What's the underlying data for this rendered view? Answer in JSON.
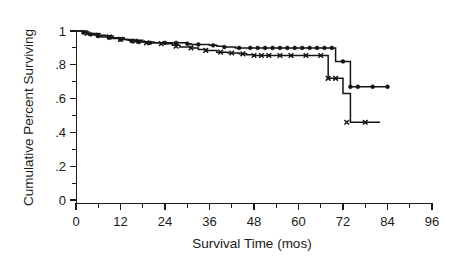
{
  "chart_data": {
    "type": "line",
    "title": "",
    "xlabel": "Survival Time (mos)",
    "ylabel": "Cumulative Percent Surviving",
    "xlim": [
      0,
      96
    ],
    "ylim": [
      0,
      1
    ],
    "grid": false,
    "legend": "none",
    "x_ticks": [
      0,
      12,
      24,
      36,
      48,
      60,
      72,
      84,
      96
    ],
    "x_tick_labels": [
      "0",
      "12",
      "24",
      "36",
      "48",
      "60",
      "72",
      "84",
      "96"
    ],
    "x_minor_ticks": [
      6,
      18,
      30,
      42,
      54,
      66,
      78,
      90
    ],
    "y_ticks": [
      0,
      0.2,
      0.4,
      0.6,
      0.8,
      1
    ],
    "y_tick_labels": [
      "0",
      ".2",
      ".4",
      ".6",
      ".8",
      "1"
    ],
    "y_minor_ticks": [
      0.1,
      0.3,
      0.5,
      0.7,
      0.9
    ],
    "series": [
      {
        "name": "group-circle",
        "marker": "circle",
        "steps_x": [
          0,
          2,
          3,
          4,
          5,
          6,
          7,
          9,
          10,
          12,
          14,
          16,
          17,
          19,
          22,
          25,
          28,
          30,
          31,
          33,
          36,
          38,
          40,
          43,
          45,
          47,
          48,
          50,
          52,
          54,
          56,
          58,
          60,
          62,
          64,
          66,
          68,
          70,
          72,
          74,
          76,
          78,
          80,
          84
        ],
        "steps_y": [
          1.0,
          0.99,
          0.985,
          0.98,
          0.975,
          0.97,
          0.965,
          0.96,
          0.955,
          0.95,
          0.945,
          0.94,
          0.935,
          0.93,
          0.93,
          0.93,
          0.93,
          0.925,
          0.92,
          0.92,
          0.915,
          0.91,
          0.905,
          0.9,
          0.9,
          0.9,
          0.9,
          0.9,
          0.9,
          0.9,
          0.9,
          0.9,
          0.9,
          0.9,
          0.9,
          0.9,
          0.9,
          0.82,
          0.82,
          0.67,
          0.67,
          0.67,
          0.67,
          0.67
        ],
        "censored_x": [
          2,
          4,
          6,
          9,
          12,
          15,
          17,
          20,
          24,
          27,
          30,
          33,
          37,
          40,
          44,
          47,
          49,
          51,
          53,
          55,
          57,
          59,
          61,
          63,
          65,
          67,
          69,
          72,
          74,
          76,
          80,
          84
        ],
        "censored_y": [
          0.99,
          0.98,
          0.97,
          0.96,
          0.95,
          0.94,
          0.935,
          0.93,
          0.93,
          0.93,
          0.925,
          0.92,
          0.915,
          0.905,
          0.9,
          0.9,
          0.9,
          0.9,
          0.9,
          0.9,
          0.9,
          0.9,
          0.9,
          0.9,
          0.9,
          0.9,
          0.9,
          0.82,
          0.67,
          0.67,
          0.67,
          0.67
        ]
      },
      {
        "name": "group-x",
        "marker": "x",
        "steps_x": [
          0,
          3,
          6,
          8,
          10,
          13,
          15,
          18,
          21,
          24,
          26,
          28,
          31,
          33,
          35,
          38,
          41,
          44,
          46,
          48,
          50,
          53,
          56,
          59,
          62,
          65,
          67,
          68,
          70,
          72,
          74,
          78,
          82
        ],
        "steps_y": [
          1.0,
          0.985,
          0.975,
          0.97,
          0.96,
          0.95,
          0.945,
          0.935,
          0.93,
          0.925,
          0.915,
          0.905,
          0.9,
          0.89,
          0.885,
          0.875,
          0.87,
          0.865,
          0.86,
          0.855,
          0.855,
          0.855,
          0.855,
          0.855,
          0.855,
          0.855,
          0.855,
          0.72,
          0.72,
          0.63,
          0.46,
          0.46,
          0.46
        ],
        "censored_x": [
          3,
          6,
          9,
          12,
          16,
          19,
          23,
          27,
          31,
          35,
          39,
          42,
          45,
          48,
          50,
          52,
          55,
          58,
          62,
          66,
          68,
          70,
          73,
          78
        ],
        "censored_y": [
          0.985,
          0.975,
          0.965,
          0.95,
          0.94,
          0.93,
          0.925,
          0.91,
          0.9,
          0.885,
          0.875,
          0.87,
          0.865,
          0.855,
          0.855,
          0.855,
          0.855,
          0.855,
          0.855,
          0.855,
          0.72,
          0.72,
          0.46,
          0.46
        ]
      }
    ]
  },
  "geometry": {
    "plot_left": 76,
    "plot_right": 432,
    "plot_top": 22,
    "plot_bottom": 203,
    "y_zero_px": 200,
    "y_one_px": 31
  },
  "colors": {
    "ink": "#141414",
    "background": "#ffffff"
  }
}
